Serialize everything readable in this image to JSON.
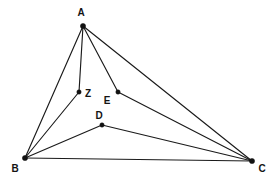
{
  "figure": {
    "type": "geometry-diagram",
    "shape": "triangle-with-interior-segments",
    "background_color": "#ffffff",
    "line_color": "#1a1a1a",
    "point_color": "#121212",
    "canvas": {
      "width": 277,
      "height": 183
    }
  },
  "points": [
    {
      "id": "A",
      "label": "A",
      "x": 83,
      "y": 26,
      "label_x": 81,
      "label_y": 16,
      "radius": 2.6
    },
    {
      "id": "B",
      "label": "B",
      "x": 25,
      "y": 158,
      "label_x": 15,
      "label_y": 172,
      "radius": 2.6
    },
    {
      "id": "C",
      "label": "C",
      "x": 252,
      "y": 161,
      "label_x": 262,
      "label_y": 172,
      "radius": 2.6
    },
    {
      "id": "Z",
      "label": "Z",
      "x": 79,
      "y": 92,
      "label_x": 88,
      "label_y": 97,
      "radius": 2.2
    },
    {
      "id": "E",
      "label": "E",
      "x": 118,
      "y": 92,
      "label_x": 107,
      "label_y": 104,
      "radius": 2.2
    },
    {
      "id": "D",
      "label": "D",
      "x": 102,
      "y": 125,
      "label_x": 99,
      "label_y": 119,
      "radius": 2.2
    }
  ],
  "segments": [
    {
      "id": "AB",
      "from": "A",
      "to": "B",
      "name": "segment-a-b"
    },
    {
      "id": "AC",
      "from": "A",
      "to": "C",
      "name": "segment-a-c"
    },
    {
      "id": "BC",
      "from": "B",
      "to": "C",
      "name": "segment-b-c"
    },
    {
      "id": "AZ",
      "from": "A",
      "to": "Z",
      "name": "segment-a-z"
    },
    {
      "id": "AE",
      "from": "A",
      "to": "E",
      "name": "segment-a-e"
    },
    {
      "id": "BZ",
      "from": "B",
      "to": "Z",
      "name": "segment-b-z"
    },
    {
      "id": "BD",
      "from": "B",
      "to": "D",
      "name": "segment-b-d"
    },
    {
      "id": "DC",
      "from": "D",
      "to": "C",
      "name": "segment-d-c"
    },
    {
      "id": "EC",
      "from": "E",
      "to": "C",
      "name": "segment-e-c"
    }
  ]
}
